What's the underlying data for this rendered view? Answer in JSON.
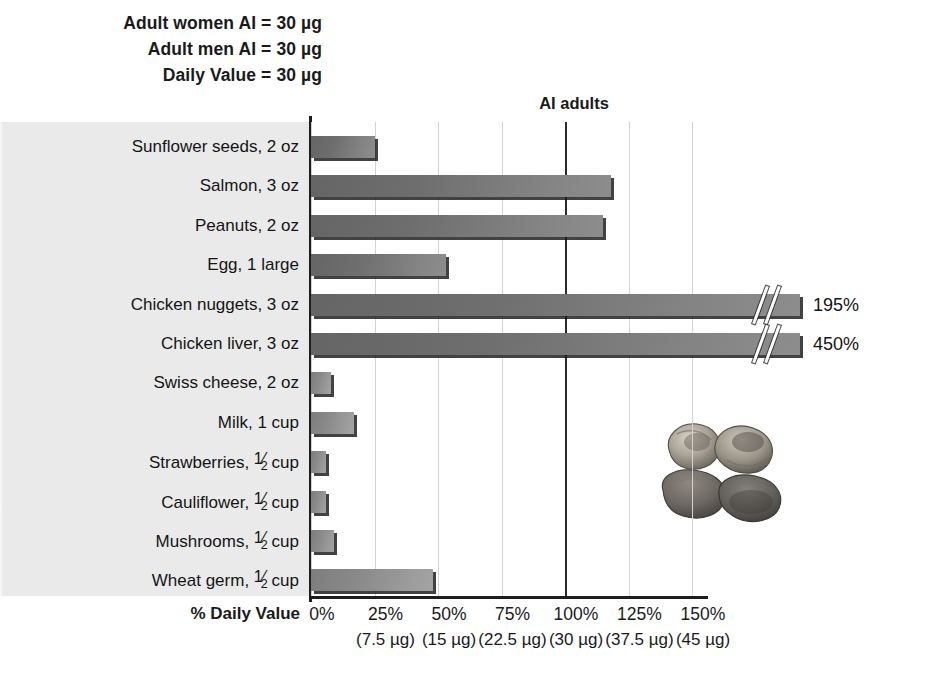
{
  "header": {
    "lines": [
      "Adult women AI = 30 µg",
      "Adult men AI = 30 µg",
      "Daily Value = 30 µg"
    ]
  },
  "plot": {
    "reference_label": "AI adults",
    "reference_percent": 100,
    "axis_title": "% Daily Value",
    "peanut_image_name": "peanuts-photo"
  },
  "chart_data": {
    "type": "bar",
    "orientation": "horizontal",
    "title": "",
    "xlabel": "% Daily Value",
    "ylabel": "",
    "xlim": [
      0,
      150
    ],
    "grid": true,
    "legend": false,
    "nutrient_unit": "µg",
    "daily_value_ug": 30,
    "reference_lines": [
      {
        "label": "AI adults",
        "value": 100
      }
    ],
    "categories": [
      "Sunflower seeds, 2 oz",
      "Salmon, 3 oz",
      "Peanuts, 2 oz",
      "Egg, 1 large",
      "Chicken nuggets, 3 oz",
      "Chicken liver, 3 oz",
      "Swiss cheese, 2 oz",
      "Milk, 1 cup",
      "Strawberries, ½ cup",
      "Cauliflower, ½ cup",
      "Mushrooms, ½ cup",
      "Wheat germ, ½ cup"
    ],
    "values": [
      25,
      118,
      115,
      53,
      195,
      450,
      8,
      17,
      6,
      6,
      9,
      48
    ],
    "tick_labels": [
      "0%",
      "25%",
      "50%",
      "75%",
      "100%",
      "125%",
      "150%"
    ],
    "tick_values": [
      0,
      25,
      50,
      75,
      100,
      125,
      150
    ],
    "tick_sublabels": [
      "",
      "(7.5 µg)",
      "(15 µg)",
      "(22.5 µg)",
      "(30 µg)",
      "(37.5 µg)",
      "(45 µg)"
    ],
    "bar_color": "#6e6e6e",
    "bar_color_light": "#8d8d8d",
    "panel_color": "#eaeaea"
  },
  "rows": [
    {
      "label_main": "Sunflower seeds, 2 oz",
      "frac": false,
      "value": 25,
      "truncated": false,
      "value_label": "",
      "tone": "dark"
    },
    {
      "label_main": "Salmon, 3 oz",
      "frac": false,
      "value": 118,
      "truncated": false,
      "value_label": "",
      "tone": "dark"
    },
    {
      "label_main": "Peanuts, 2 oz",
      "frac": false,
      "value": 115,
      "truncated": false,
      "value_label": "",
      "tone": "dark"
    },
    {
      "label_main": "Egg, 1 large",
      "frac": false,
      "value": 53,
      "truncated": false,
      "value_label": "",
      "tone": "dark"
    },
    {
      "label_main": "Chicken nuggets, 3 oz",
      "frac": false,
      "value": 195,
      "truncated": true,
      "value_label": "195%",
      "tone": "dark"
    },
    {
      "label_main": "Chicken liver, 3 oz",
      "frac": false,
      "value": 450,
      "truncated": true,
      "value_label": "450%",
      "tone": "dark"
    },
    {
      "label_main": "Swiss cheese, 2 oz",
      "frac": false,
      "value": 8,
      "truncated": false,
      "value_label": "",
      "tone": "light"
    },
    {
      "label_main": "Milk, 1 cup",
      "frac": false,
      "value": 17,
      "truncated": false,
      "value_label": "",
      "tone": "light"
    },
    {
      "label_pre": "Strawberries,",
      "label_post": "cup",
      "frac": true,
      "value": 6,
      "truncated": false,
      "value_label": "",
      "tone": "light"
    },
    {
      "label_pre": "Cauliflower,",
      "label_post": "cup",
      "frac": true,
      "value": 6,
      "truncated": false,
      "value_label": "",
      "tone": "light"
    },
    {
      "label_pre": "Mushrooms,",
      "label_post": "cup",
      "frac": true,
      "value": 9,
      "truncated": false,
      "value_label": "",
      "tone": "light"
    },
    {
      "label_pre": "Wheat germ,",
      "label_post": "cup",
      "frac": true,
      "value": 48,
      "truncated": false,
      "value_label": "",
      "tone": "light"
    }
  ],
  "fraction": {
    "numerator": "1",
    "denominator": "2"
  }
}
